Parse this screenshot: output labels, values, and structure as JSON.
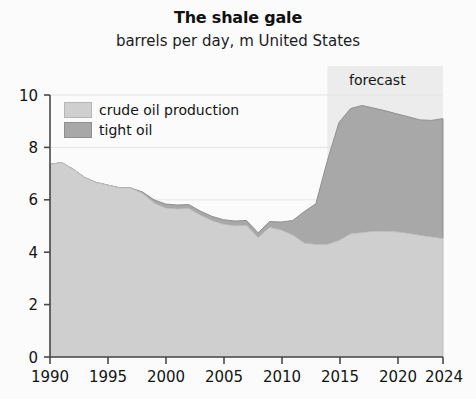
{
  "chart_data": {
    "type": "area",
    "stacked": true,
    "title": "The shale gale",
    "subtitle": "barrels per day, m United States",
    "xlabel": "",
    "ylabel": "",
    "xlim": [
      1990,
      2024
    ],
    "ylim": [
      0,
      10
    ],
    "xticks": [
      1990,
      1995,
      2000,
      2005,
      2010,
      2015,
      2020,
      2024
    ],
    "yticks": [
      0,
      2,
      4,
      6,
      8,
      10
    ],
    "grid": "horizontal-light",
    "legend_position": "top-left-inside",
    "annotations": [
      {
        "text": "forecast",
        "type": "shaded-region",
        "x_start": 2014,
        "x_end": 2024
      }
    ],
    "x": [
      1990,
      1991,
      1992,
      1993,
      1994,
      1995,
      1996,
      1997,
      1998,
      1999,
      2000,
      2001,
      2002,
      2003,
      2004,
      2005,
      2006,
      2007,
      2008,
      2009,
      2010,
      2011,
      2012,
      2013,
      2014,
      2015,
      2016,
      2017,
      2018,
      2019,
      2020,
      2021,
      2022,
      2023,
      2024
    ],
    "series": [
      {
        "name": "crude oil production",
        "color": "#cfcfcf",
        "values": [
          7.35,
          7.42,
          7.17,
          6.85,
          6.66,
          6.56,
          6.46,
          6.45,
          6.25,
          5.88,
          5.69,
          5.65,
          5.67,
          5.42,
          5.21,
          5.07,
          5.01,
          5.02,
          4.56,
          4.95,
          4.85,
          4.66,
          4.35,
          4.3,
          4.3,
          4.45,
          4.7,
          4.75,
          4.8,
          4.8,
          4.78,
          4.72,
          4.65,
          4.58,
          4.52
        ]
      },
      {
        "name": "tight oil",
        "color": "#a8a8a8",
        "values": [
          0.0,
          0.0,
          0.0,
          0.0,
          0.0,
          0.0,
          0.0,
          0.0,
          0.05,
          0.12,
          0.15,
          0.15,
          0.15,
          0.15,
          0.16,
          0.17,
          0.18,
          0.19,
          0.18,
          0.22,
          0.3,
          0.55,
          1.2,
          1.55,
          3.2,
          4.5,
          4.78,
          4.85,
          4.7,
          4.6,
          4.5,
          4.45,
          4.4,
          4.45,
          4.58
        ]
      }
    ],
    "totals": [
      7.35,
      7.42,
      7.17,
      6.85,
      6.66,
      6.56,
      6.46,
      6.45,
      6.3,
      6.0,
      5.84,
      5.8,
      5.82,
      5.57,
      5.37,
      5.24,
      5.19,
      5.21,
      4.74,
      5.17,
      5.15,
      5.21,
      5.55,
      5.85,
      7.5,
      8.95,
      9.48,
      9.6,
      9.5,
      9.4,
      9.28,
      9.17,
      9.05,
      9.03,
      9.1
    ]
  },
  "legend": {
    "items": [
      {
        "label": "crude oil production",
        "color": "#cfcfcf"
      },
      {
        "label": "tight oil",
        "color": "#a8a8a8"
      }
    ]
  },
  "forecast": {
    "label": "forecast"
  },
  "axes": {
    "y_labels": [
      "10",
      "8",
      "6",
      "4",
      "2",
      "0"
    ],
    "x_labels": [
      "1990",
      "1995",
      "2000",
      "2005",
      "2010",
      "2015",
      "2020",
      "2024"
    ]
  },
  "colors": {
    "crude": "#cfcfcf",
    "tight": "#a8a8a8",
    "forecast_band": "#ececec",
    "axis": "#4a4a4a",
    "background": "#fbfbfb"
  }
}
